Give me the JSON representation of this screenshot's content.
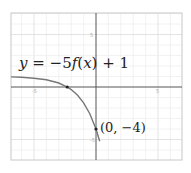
{
  "chart_data": {
    "type": "line",
    "title": "",
    "xlabel": "",
    "ylabel": "",
    "xlim": [
      -6.9,
      6.9
    ],
    "ylim": [
      -7,
      7
    ],
    "grid": true,
    "x_ticks": [
      -5,
      5
    ],
    "y_ticks": [
      5,
      -5
    ],
    "x_tick_labels": [
      "-5",
      "5"
    ],
    "y_tick_labels": [
      "5",
      "-5"
    ],
    "series": [
      {
        "name": "y = -5f(x) + 1",
        "x": [
          -6.9,
          -6,
          -5,
          -4,
          -3,
          -2.32,
          -2,
          -1.5,
          -1,
          -0.5,
          0,
          0.3
        ],
        "y": [
          0.96,
          0.92,
          0.84,
          0.69,
          0.38,
          0,
          -0.25,
          -0.77,
          -1.5,
          -2.54,
          -4,
          -5.16
        ]
      }
    ],
    "points": [
      {
        "x": -2.32,
        "y": 0,
        "label": ""
      },
      {
        "x": 0,
        "y": -4,
        "label": "(0, −4)"
      }
    ],
    "annotations": [
      {
        "text": "y = −5f(x) + 1",
        "x": -6.2,
        "y": 2.5
      },
      {
        "text": "(0, −4)",
        "x": 0.3,
        "y": -4
      }
    ]
  },
  "labels": {
    "equation_y": "y",
    "equation_eq": " = −5",
    "equation_f": "f",
    "equation_paren_open": "(",
    "equation_x": "x",
    "equation_rest": ") + 1",
    "point": "(0, −4)"
  }
}
